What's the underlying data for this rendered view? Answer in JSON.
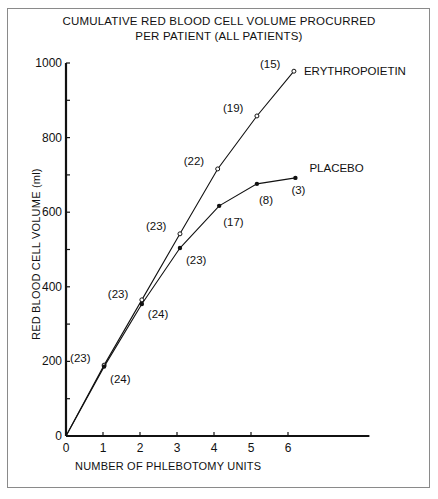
{
  "chart_data": {
    "type": "line",
    "title": "CUMULATIVE RED BLOOD CELL VOLUME PROCURRED PER PATIENT (ALL PATIENTS)",
    "title_lines": [
      "CUMULATIVE RED BLOOD CELL VOLUME PROCURRED",
      "PER PATIENT (ALL PATIENTS)"
    ],
    "xlabel": "NUMBER OF PHLEBOTOMY UNITS",
    "ylabel": "RED BLOOD CELL VOLUME (ml)",
    "xlim": [
      0,
      8.2
    ],
    "ylim": [
      0,
      1000
    ],
    "x_ticks": [
      0,
      1,
      2,
      3,
      4,
      5,
      6
    ],
    "x_tick_labels": [
      "0",
      "1",
      "2",
      "3",
      "4",
      "5",
      "6"
    ],
    "y_ticks": [
      0,
      100,
      200,
      300,
      400,
      500,
      600,
      700,
      800,
      900,
      1000
    ],
    "y_tick_labels": [
      "0",
      "",
      "200",
      "",
      "400",
      "",
      "600",
      "",
      "800",
      "",
      "1000"
    ],
    "grid": false,
    "legend_position": "inline labels at line ends",
    "series": [
      {
        "name": "ERYTHROPOIETIN",
        "marker": "open-circle",
        "x": [
          0,
          1.03,
          2.05,
          3.08,
          4.1,
          5.16,
          6.16
        ],
        "values": [
          0,
          190,
          365,
          542,
          716,
          858,
          978
        ],
        "annotations": [
          "",
          "(23)",
          "(23)",
          "(23)",
          "(22)",
          "(19)",
          "(15)"
        ]
      },
      {
        "name": "PLACEBO",
        "marker": "filled-circle",
        "x": [
          0,
          1.03,
          2.05,
          3.08,
          4.14,
          5.16,
          6.2
        ],
        "values": [
          0,
          186,
          354,
          504,
          617,
          676,
          692
        ],
        "annotations": [
          "",
          "(24)",
          "(24)",
          "(23)",
          "(17)",
          "(8)",
          "(3)"
        ]
      }
    ]
  }
}
